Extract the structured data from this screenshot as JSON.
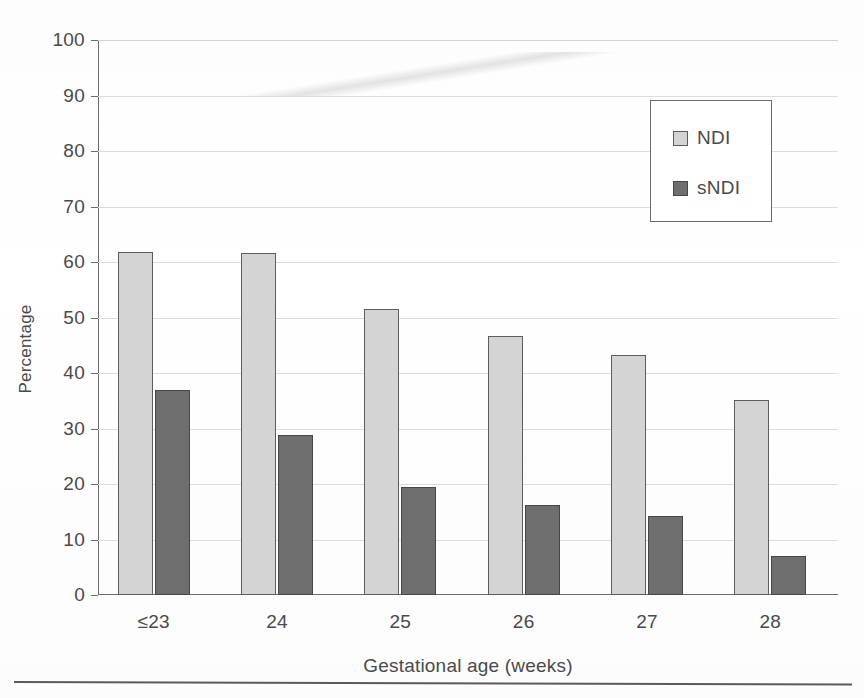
{
  "chart_data": {
    "type": "bar",
    "title": "",
    "xlabel": "Gestational age (weeks)",
    "ylabel": "Percentage",
    "categories": [
      "≤23",
      "24",
      "25",
      "26",
      "27",
      "28"
    ],
    "series": [
      {
        "name": "NDI",
        "color": "#d4d4d4",
        "values": [
          61.8,
          61.6,
          51.6,
          46.6,
          43.2,
          35.2
        ]
      },
      {
        "name": "sNDI",
        "color": "#6e6e6e",
        "values": [
          37.0,
          28.8,
          19.5,
          16.3,
          14.2,
          7.0
        ]
      }
    ],
    "ylim": [
      0,
      100
    ],
    "yticks": [
      0,
      10,
      20,
      30,
      40,
      50,
      60,
      70,
      80,
      90,
      100
    ],
    "ytick_labels": [
      "0",
      "10",
      "20",
      "30",
      "40",
      "50",
      "60",
      "70",
      "80",
      "90",
      "100"
    ],
    "grid": true,
    "legend_position": "top-right",
    "legend_entries": [
      "NDI",
      "sNDI"
    ]
  },
  "axis": {
    "y_title": "Percentage",
    "x_title": "Gestational age (weeks)"
  },
  "legend": {
    "items": [
      {
        "label": "NDI"
      },
      {
        "label": "sNDI"
      }
    ]
  }
}
